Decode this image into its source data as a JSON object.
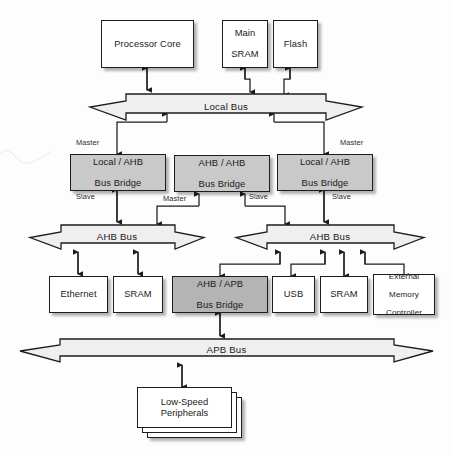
{
  "diagram": {
    "background": "#fdfdfd",
    "box_fill": "#ffffff",
    "bridge_fill": "#c9c9c9",
    "apb_bridge_fill": "#b4b4b4",
    "line_color": "#1d1d1d"
  },
  "top_row": {
    "processor_core": "Processor Core",
    "main_sram_line1": "Main",
    "main_sram_line2": "SRAM",
    "flash": "Flash"
  },
  "buses": {
    "local_bus": "Local Bus",
    "ahb_bus_left": "AHB Bus",
    "ahb_bus_right": "AHB Bus",
    "apb_bus": "APB Bus"
  },
  "bridges": [
    {
      "line1": "Local / AHB",
      "line2": "Bus Bridge"
    },
    {
      "line1": "AHB / AHB",
      "line2": "Bus Bridge"
    },
    {
      "line1": "Local / AHB",
      "line2": "Bus Bridge"
    }
  ],
  "apb_bridge": {
    "line1": "AHB / APB",
    "line2": "Bus Bridge"
  },
  "peripherals_left": [
    {
      "label": "Ethernet"
    },
    {
      "label": "SRAM"
    }
  ],
  "peripherals_right": [
    {
      "label": "USB"
    },
    {
      "label": "SRAM"
    },
    {
      "line1": "External",
      "line2": "Memory",
      "line3": "Controller"
    }
  ],
  "low_speed": {
    "line1": "Low-Speed",
    "line2": "Peripherals"
  },
  "captions": {
    "master_1": "Master",
    "slave_1": "Slave",
    "master_2": "Master",
    "slave_2": "Slave",
    "master_3": "Master",
    "slave_3": "Slave"
  }
}
